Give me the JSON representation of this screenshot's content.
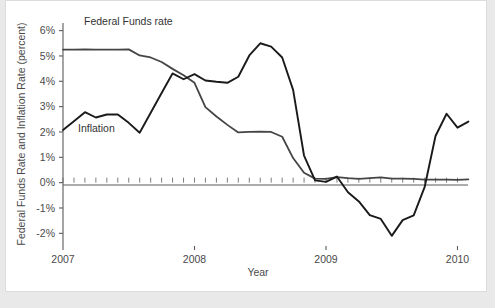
{
  "chart_data": {
    "type": "line",
    "title": "",
    "xlabel": "Year",
    "ylabel": "Federal Funds Rate and Inflation Rate (percent)",
    "xlim": [
      2007.0,
      2010.08
    ],
    "ylim": [
      -2.5,
      6.3
    ],
    "xtick_labels": [
      "2007",
      "2008",
      "2009",
      "2010"
    ],
    "xtick_values": [
      2007,
      2008,
      2009,
      2010
    ],
    "ytick_labels": [
      "6%",
      "5%",
      "4%",
      "3%",
      "2%",
      "1%",
      "0%",
      "-1%",
      "-2%"
    ],
    "ytick_values": [
      6,
      5,
      4,
      3,
      2,
      1,
      0,
      -1,
      -2
    ],
    "grid": false,
    "legend_position": "inline-annotations",
    "minor_ticks": "monthly on zero line",
    "series": [
      {
        "name": "Federal Funds rate",
        "label_text": "Federal Funds rate",
        "color": "#454545",
        "x": [
          2007.0,
          2007.083,
          2007.167,
          2007.25,
          2007.333,
          2007.417,
          2007.5,
          2007.583,
          2007.667,
          2007.75,
          2007.833,
          2007.917,
          2008.0,
          2008.083,
          2008.167,
          2008.25,
          2008.333,
          2008.417,
          2008.5,
          2008.583,
          2008.667,
          2008.75,
          2008.833,
          2008.917,
          2009.0,
          2009.083,
          2009.167,
          2009.25,
          2009.333,
          2009.417,
          2009.5,
          2009.583,
          2009.667,
          2009.75,
          2009.833,
          2009.917,
          2010.0,
          2010.083
        ],
        "values": [
          5.25,
          5.25,
          5.26,
          5.25,
          5.25,
          5.25,
          5.26,
          5.02,
          4.94,
          4.76,
          4.49,
          4.24,
          3.94,
          2.98,
          2.61,
          2.28,
          1.98,
          2.0,
          2.01,
          2.0,
          1.81,
          0.97,
          0.39,
          0.16,
          0.15,
          0.22,
          0.18,
          0.15,
          0.18,
          0.21,
          0.16,
          0.16,
          0.15,
          0.12,
          0.12,
          0.12,
          0.11,
          0.13
        ]
      },
      {
        "name": "Inflation",
        "label_text": "Inflation",
        "color": "#1a1a1a",
        "x": [
          2007.0,
          2007.083,
          2007.167,
          2007.25,
          2007.333,
          2007.417,
          2007.5,
          2007.583,
          2007.667,
          2007.75,
          2007.833,
          2007.917,
          2008.0,
          2008.083,
          2008.167,
          2008.25,
          2008.333,
          2008.417,
          2008.5,
          2008.583,
          2008.667,
          2008.75,
          2008.833,
          2008.917,
          2009.0,
          2009.083,
          2009.167,
          2009.25,
          2009.333,
          2009.417,
          2009.5,
          2009.583,
          2009.667,
          2009.75,
          2009.833,
          2009.917,
          2010.0,
          2010.083
        ],
        "values": [
          2.08,
          2.42,
          2.78,
          2.57,
          2.69,
          2.69,
          2.36,
          1.97,
          2.76,
          3.54,
          4.31,
          4.08,
          4.28,
          4.03,
          3.98,
          3.94,
          4.18,
          5.02,
          5.5,
          5.37,
          4.94,
          3.66,
          1.07,
          0.09,
          0.03,
          0.24,
          -0.38,
          -0.74,
          -1.28,
          -1.43,
          -2.1,
          -1.48,
          -1.29,
          -0.18,
          1.84,
          2.72,
          2.17,
          2.41
        ]
      }
    ]
  },
  "annotations": {
    "ffr_label": "Federal Funds rate",
    "inflation_label": "Inflation"
  },
  "axis": {
    "y_title": "Federal Funds Rate and Inflation Rate (percent)",
    "x_title": "Year"
  }
}
